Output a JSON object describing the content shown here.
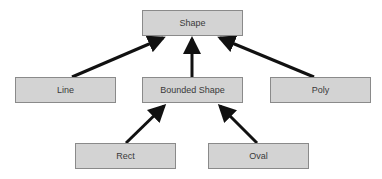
{
  "diagram": {
    "nodes": [
      {
        "id": "shape",
        "label": "Shape"
      },
      {
        "id": "line",
        "label": "Line"
      },
      {
        "id": "bounded_shape",
        "label": "Bounded Shape"
      },
      {
        "id": "poly",
        "label": "Poly"
      },
      {
        "id": "rect",
        "label": "Rect"
      },
      {
        "id": "oval",
        "label": "Oval"
      }
    ],
    "edges": [
      {
        "from": "line",
        "to": "shape"
      },
      {
        "from": "bounded_shape",
        "to": "shape"
      },
      {
        "from": "poly",
        "to": "shape"
      },
      {
        "from": "rect",
        "to": "bounded_shape"
      },
      {
        "from": "oval",
        "to": "bounded_shape"
      }
    ],
    "colors": {
      "box_fill": "#d3d3d3",
      "box_border": "#8a8a8a",
      "arrow": "#111111",
      "text": "#3a3a3a"
    }
  }
}
